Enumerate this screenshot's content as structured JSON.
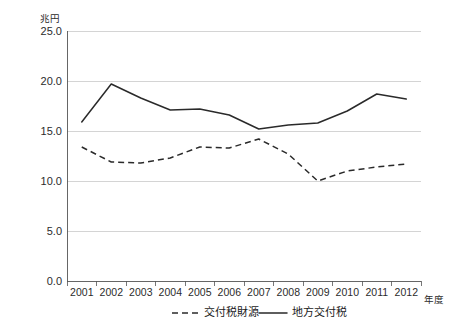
{
  "chart_data": {
    "type": "line",
    "title": "",
    "unit_label": "兆円",
    "xlabel": "年度",
    "ylabel": "",
    "categories": [
      "2001",
      "2002",
      "2003",
      "2004",
      "2005",
      "2006",
      "2007",
      "2008",
      "2009",
      "2010",
      "2011",
      "2012"
    ],
    "ylim": [
      0.0,
      25.0
    ],
    "yticks": [
      "0.0",
      "5.0",
      "10.0",
      "15.0",
      "20.0",
      "25.0"
    ],
    "ytick_values": [
      0.0,
      5.0,
      10.0,
      15.0,
      20.0,
      25.0
    ],
    "grid": true,
    "legend_position": "bottom",
    "series": [
      {
        "name": "交付税財源",
        "style": "dashed",
        "color": "#2a2a2a",
        "values": [
          13.4,
          11.9,
          11.8,
          12.3,
          13.4,
          13.3,
          14.2,
          12.7,
          10.0,
          11.0,
          11.4,
          11.7
        ]
      },
      {
        "name": "地方交付税",
        "style": "solid",
        "color": "#2a2a2a",
        "values": [
          15.9,
          19.7,
          18.3,
          17.1,
          17.2,
          16.6,
          15.2,
          15.6,
          15.8,
          17.0,
          18.7,
          18.2
        ]
      }
    ]
  },
  "legend": {
    "items": [
      {
        "label": "交付税財源",
        "style": "dashed"
      },
      {
        "label": "地方交付税",
        "style": "solid"
      }
    ]
  },
  "axes": {
    "y_unit": "兆円",
    "x_name": "年度"
  }
}
